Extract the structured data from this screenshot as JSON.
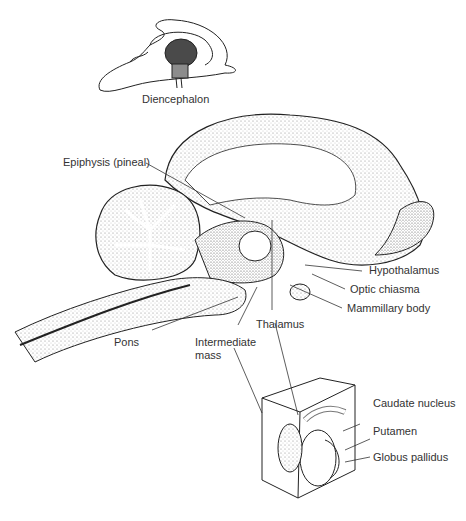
{
  "figure": {
    "inset_top": {
      "label": "Diencephalon"
    },
    "main_brain": {
      "labels": {
        "epiphysis": "Epiphysis (pineal)",
        "hypothalamus": "Hypothalamus",
        "optic_chiasma": "Optic chiasma",
        "mammillary_body": "Mammillary body",
        "thalamus": "Thalamus",
        "pons": "Pons",
        "intermediate_mass_line1": "Intermediate",
        "intermediate_mass_line2": "mass"
      }
    },
    "inset_bottom": {
      "labels": {
        "caudate_nucleus": "Caudate nucleus",
        "putamen": "Putamen",
        "globus_pallidus": "Globus pallidus"
      }
    },
    "colors": {
      "line": "#222222",
      "stipple": "#9a9a9a",
      "dark_region": "#4a4a4a",
      "mid_region": "#8c8c8c"
    }
  }
}
